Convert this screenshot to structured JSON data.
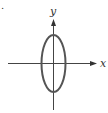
{
  "figure": {
    "marker": ".",
    "axes": {
      "x_label": "x",
      "y_label": "y"
    },
    "shape": {
      "type": "ellipse",
      "orientation": "vertical",
      "center": [
        0,
        0
      ],
      "stroke_color": "#555555"
    },
    "colors": {
      "axis": "#333333",
      "background": "#ffffff"
    }
  }
}
